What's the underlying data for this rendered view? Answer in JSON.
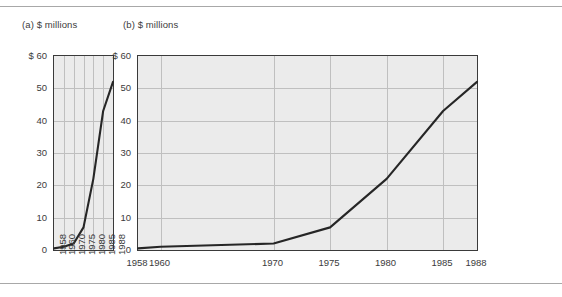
{
  "figure": {
    "panel_a_title": "(a) $ millions",
    "panel_b_title": "(b) $ millions"
  },
  "chart_data": [
    {
      "id": "panel-a",
      "type": "line",
      "title": "(a) $ millions",
      "xlabel": "",
      "ylabel": "$ millions",
      "x_axis_type": "categorical",
      "categories": [
        "1958",
        "1960",
        "1970",
        "1975",
        "1980",
        "1985",
        "1988"
      ],
      "values": [
        0.5,
        1,
        2,
        7,
        22,
        43,
        52
      ],
      "ylim": [
        0,
        60
      ],
      "ytick_labels": [
        "$ 60",
        "50",
        "40",
        "30",
        "20",
        "10",
        "0"
      ],
      "yticks": [
        60,
        50,
        40,
        30,
        20,
        10,
        0
      ],
      "xtick_labels": [
        "1958",
        "1960",
        "1970",
        "1975",
        "1980",
        "1985",
        "1988"
      ],
      "xtick_rotation": -90,
      "grid": "both",
      "legend": "none",
      "plot_background": "#ebebeb",
      "line_color": "#262626"
    },
    {
      "id": "panel-b",
      "type": "line",
      "title": "(b) $ millions",
      "xlabel": "",
      "ylabel": "$ millions",
      "x_axis_type": "linear",
      "x": [
        1958,
        1960,
        1970,
        1975,
        1980,
        1985,
        1988
      ],
      "values": [
        0.5,
        1,
        2,
        7,
        22,
        43,
        52
      ],
      "xlim": [
        1958,
        1988
      ],
      "ylim": [
        0,
        60
      ],
      "ytick_labels": [
        "$ 60",
        "50",
        "40",
        "30",
        "20",
        "10",
        "0"
      ],
      "yticks": [
        60,
        50,
        40,
        30,
        20,
        10,
        0
      ],
      "xtick_labels": [
        "1958",
        "1960",
        "1970",
        "1975",
        "1980",
        "1985",
        "1988"
      ],
      "xticks": [
        1958,
        1960,
        1970,
        1975,
        1980,
        1985,
        1988
      ],
      "xtick_rotation": 0,
      "grid": "both",
      "legend": "none",
      "plot_background": "#ebebeb",
      "line_color": "#262626"
    }
  ]
}
